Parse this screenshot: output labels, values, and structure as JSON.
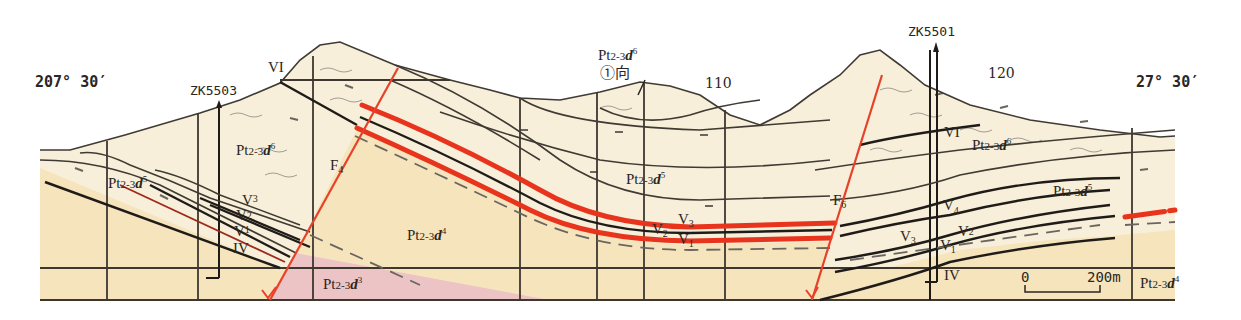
{
  "figure": {
    "type": "geological cross-section",
    "coordinates": {
      "left": "207° 30′",
      "right": "27° 30′"
    },
    "boreholes": [
      {
        "id": "ZK5503",
        "label": "ZK5503"
      },
      {
        "id": "ZK5501",
        "label": "ZK5501"
      }
    ],
    "elevation_labels": [
      "110",
      "120"
    ],
    "faults": [
      {
        "id": "F4",
        "label": "F",
        "sub": "4"
      },
      {
        "id": "F6",
        "label": "F",
        "sub": "6"
      }
    ],
    "strata": [
      {
        "id": "d6-left",
        "base": "Pt",
        "sub": "2-3",
        "ital": "d",
        "sup": "6"
      },
      {
        "id": "d5-left",
        "base": "Pt",
        "sub": "2-3",
        "ital": "d",
        "sup": "5"
      },
      {
        "id": "d4-center",
        "base": "Pt",
        "sub": "2-3",
        "ital": "d",
        "sup": "4"
      },
      {
        "id": "d3-bottom",
        "base": "Pt",
        "sub": "2-3",
        "ital": "d",
        "sup": "3"
      },
      {
        "id": "d5-center",
        "base": "Pt",
        "sub": "2-3",
        "ital": "d",
        "sup": "5"
      },
      {
        "id": "d6-top",
        "base": "Pt",
        "sub": "2-3",
        "ital": "d",
        "sup": "6"
      },
      {
        "id": "d6-right",
        "base": "Pt",
        "sub": "2-3",
        "ital": "d",
        "sup": "6"
      },
      {
        "id": "d5-right",
        "base": "Pt",
        "sub": "2-3",
        "ital": "d",
        "sup": "5"
      },
      {
        "id": "d4-right",
        "base": "Pt",
        "sub": "2-3",
        "ital": "d",
        "sup": "4"
      }
    ],
    "syncline_label": "①向",
    "veins": {
      "left": [
        {
          "main": "V",
          "sub": "3"
        },
        {
          "main": "V",
          "sub": "2"
        },
        {
          "main": "V",
          "sub": "1"
        },
        {
          "main": "IV",
          "sub": ""
        },
        {
          "main": "VI",
          "sub": ""
        }
      ],
      "center": [
        {
          "main": "V",
          "sub": "3"
        },
        {
          "main": "V",
          "sub": "2"
        },
        {
          "main": "V",
          "sub": "1"
        }
      ],
      "right": [
        {
          "main": "VI",
          "sub": ""
        },
        {
          "main": "V",
          "sub": "4"
        },
        {
          "main": "V",
          "sub": "3"
        },
        {
          "main": "V",
          "sub": "2"
        },
        {
          "main": "V",
          "sub": "1"
        },
        {
          "main": "IV",
          "sub": ""
        }
      ]
    },
    "scale_bar": {
      "start": "0",
      "end": "200m"
    },
    "colors": {
      "upper_fill": "#f7efd9",
      "lower_fill": "#f6e4bd",
      "pink_fill": "#ecc4c6",
      "ore_red": "#e8341c",
      "fault_red": "#e8412a",
      "line": "#2b2622"
    }
  }
}
